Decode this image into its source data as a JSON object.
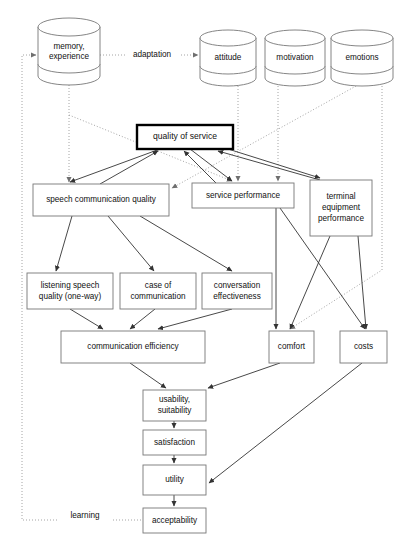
{
  "diagram": {
    "colors": {
      "box_stroke": "#777777",
      "emphasis_stroke": "#000000",
      "solid_edge": "#333333",
      "dotted_edge": "#9a9a9a",
      "background": "#ffffff",
      "text": "#111111"
    },
    "cylinders": [
      {
        "id": "memory",
        "lines": [
          "memory,",
          "experience"
        ],
        "x": 38,
        "y": 18,
        "w": 62,
        "h": 67,
        "rx": 31,
        "ry": 9
      },
      {
        "id": "attitude",
        "lines": [
          "attitude"
        ],
        "x": 200,
        "y": 30,
        "w": 56,
        "h": 56,
        "rx": 28,
        "ry": 8
      },
      {
        "id": "motivation",
        "lines": [
          "motivation"
        ],
        "x": 265,
        "y": 30,
        "w": 60,
        "h": 56,
        "rx": 30,
        "ry": 8
      },
      {
        "id": "emotions",
        "lines": [
          "emotions"
        ],
        "x": 331,
        "y": 30,
        "w": 62,
        "h": 56,
        "rx": 31,
        "ry": 8
      }
    ],
    "boxes": [
      {
        "id": "quality-of-service",
        "lines": [
          "quality of service"
        ],
        "x": 137,
        "y": 125,
        "w": 96,
        "h": 24,
        "emphasis": true
      },
      {
        "id": "speech-communication-quality",
        "lines": [
          "speech communication quality"
        ],
        "x": 33,
        "y": 184,
        "w": 136,
        "h": 32,
        "emphasis": false
      },
      {
        "id": "service-performance",
        "lines": [
          "service performance"
        ],
        "x": 192,
        "y": 183,
        "w": 102,
        "h": 25,
        "emphasis": false
      },
      {
        "id": "terminal-equipment-performance",
        "lines": [
          "terminal",
          "equipment",
          "performance"
        ],
        "x": 310,
        "y": 180,
        "w": 62,
        "h": 56,
        "emphasis": false
      },
      {
        "id": "listening-speech-quality",
        "lines": [
          "listening speech",
          "quality (one-way)"
        ],
        "x": 27,
        "y": 273,
        "w": 86,
        "h": 36,
        "emphasis": false
      },
      {
        "id": "case-of-communication",
        "lines": [
          "case of",
          "communication"
        ],
        "x": 120,
        "y": 273,
        "w": 76,
        "h": 36,
        "emphasis": false
      },
      {
        "id": "conversation-effectiveness",
        "lines": [
          "conversation",
          "effectiveness"
        ],
        "x": 202,
        "y": 273,
        "w": 70,
        "h": 36,
        "emphasis": false
      },
      {
        "id": "communication-efficiency",
        "lines": [
          "communication efficiency"
        ],
        "x": 61,
        "y": 331,
        "w": 144,
        "h": 32,
        "emphasis": false
      },
      {
        "id": "comfort",
        "lines": [
          "comfort"
        ],
        "x": 269,
        "y": 331,
        "w": 45,
        "h": 32,
        "emphasis": false
      },
      {
        "id": "costs",
        "lines": [
          "costs"
        ],
        "x": 340,
        "y": 331,
        "w": 47,
        "h": 32,
        "emphasis": false
      },
      {
        "id": "usability-suitability",
        "lines": [
          "usability,",
          "suitability"
        ],
        "x": 143,
        "y": 390,
        "w": 63,
        "h": 31,
        "emphasis": false
      },
      {
        "id": "satisfaction",
        "lines": [
          "satisfaction"
        ],
        "x": 143,
        "y": 430,
        "w": 63,
        "h": 25,
        "emphasis": false
      },
      {
        "id": "utility",
        "lines": [
          "utility"
        ],
        "x": 143,
        "y": 465,
        "w": 63,
        "h": 30,
        "emphasis": false
      },
      {
        "id": "acceptability",
        "lines": [
          "acceptability"
        ],
        "x": 143,
        "y": 508,
        "w": 63,
        "h": 25,
        "emphasis": false
      }
    ],
    "edge_labels": [
      {
        "id": "adaptation",
        "text": "adaptation",
        "x": 152,
        "y": 55
      },
      {
        "id": "learning",
        "text": "learning",
        "x": 85,
        "y": 516
      }
    ],
    "solid_edges": [
      {
        "id": "scq-to-qos",
        "from": "speech-communication-quality",
        "to": "quality-of-service",
        "d": "M 100 184 L 158 151"
      },
      {
        "id": "sp-to-qos",
        "from": "service-performance",
        "to": "quality-of-service",
        "d": "M 216 183 L 184 151"
      },
      {
        "id": "tep-to-qos",
        "from": "terminal-equipment-performance",
        "to": "quality-of-service",
        "d": "M 320 180 L 218 151"
      },
      {
        "id": "qos-to-scq",
        "from": "quality-of-service",
        "to": "speech-communication-quality",
        "d": "M 160 149 L 70 182"
      },
      {
        "id": "qos-to-sp",
        "from": "quality-of-service",
        "to": "service-performance",
        "d": "M 190 149 L 232 181"
      },
      {
        "id": "qos-to-tep",
        "from": "quality-of-service",
        "to": "terminal-equipment-performance",
        "d": "M 228 149 L 320 178"
      },
      {
        "id": "scq-to-lsq",
        "from": "speech-communication-quality",
        "to": "listening-speech-quality",
        "d": "M 72 216 L 56 271"
      },
      {
        "id": "scq-to-coc",
        "from": "speech-communication-quality",
        "to": "case-of-communication",
        "d": "M 108 216 L 154 271"
      },
      {
        "id": "scq-to-ce",
        "from": "speech-communication-quality",
        "to": "conversation-effectiveness",
        "d": "M 140 216 L 232 271"
      },
      {
        "id": "lsq-to-ce2",
        "from": "listening-speech-quality",
        "to": "communication-efficiency",
        "d": "M 70 309 L 103 329"
      },
      {
        "id": "coc-to-ce2",
        "from": "case-of-communication",
        "to": "communication-efficiency",
        "d": "M 155 309 L 130 329"
      },
      {
        "id": "ce-to-ce2",
        "from": "conversation-effectiveness",
        "to": "communication-efficiency",
        "d": "M 232 309 L 158 329"
      },
      {
        "id": "sp-to-comfort",
        "from": "service-performance",
        "to": "comfort",
        "d": "M 276 208 L 276 329"
      },
      {
        "id": "sp-to-costs",
        "from": "service-performance",
        "to": "costs",
        "d": "M 280 208 L 365 329"
      },
      {
        "id": "tep-to-comfort",
        "from": "terminal-equipment-performance",
        "to": "comfort",
        "d": "M 330 236 L 290 329"
      },
      {
        "id": "tep-to-costs",
        "from": "terminal-equipment-performance",
        "to": "costs",
        "d": "M 358 236 L 366 329"
      },
      {
        "id": "ce2-to-us",
        "from": "communication-efficiency",
        "to": "usability-suitability",
        "d": "M 130 363 L 166 388"
      },
      {
        "id": "comfort-to-us",
        "from": "comfort",
        "to": "usability-suitability",
        "d": "M 280 363 L 208 388"
      },
      {
        "id": "us-to-sat",
        "from": "usability-suitability",
        "to": "satisfaction",
        "d": "M 174 421 L 174 428"
      },
      {
        "id": "sat-to-util",
        "from": "satisfaction",
        "to": "utility",
        "d": "M 174 455 L 174 463"
      },
      {
        "id": "costs-to-util",
        "from": "costs",
        "to": "utility",
        "d": "M 362 363 L 209 483"
      },
      {
        "id": "util-to-acc",
        "from": "utility",
        "to": "acceptability",
        "d": "M 174 495 L 174 506"
      }
    ],
    "dotted_edges": [
      {
        "id": "memory-to-attitude-adaptation",
        "from": "memory",
        "to": "attitude",
        "d": "M 100 55 L 198 55"
      },
      {
        "id": "feedback-left-to-memory",
        "from": "acceptability",
        "to": "memory",
        "d": "M 174 520 L 22 520 L 22 55 L 36 55"
      },
      {
        "id": "memory-down-to-scq",
        "from": "memory",
        "to": "speech-communication-quality",
        "d": "M 69 85 L 69 182"
      },
      {
        "id": "memory-diag-to-sp",
        "from": "memory",
        "to": "service-performance",
        "d": "M 69 115 L 232 181"
      },
      {
        "id": "attitude-down-to-sp",
        "from": "attitude",
        "to": "service-performance",
        "d": "M 238 86 L 238 181"
      },
      {
        "id": "motivation-down-to-sp",
        "from": "motivation",
        "to": "service-performance",
        "d": "M 278 86 L 278 181"
      },
      {
        "id": "emotions-diag-to-scq",
        "from": "emotions",
        "to": "speech-communication-quality",
        "d": "M 356 86 L 172 188"
      },
      {
        "id": "emotions-down-to-comfort",
        "from": "emotions",
        "to": "comfort",
        "d": "M 382 86 L 382 270 L 290 329"
      }
    ]
  }
}
